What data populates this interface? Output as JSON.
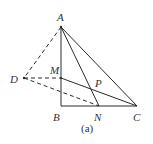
{
  "figure": {
    "caption": "(a)",
    "stroke_color": "#2a2a2a",
    "points": {
      "A": {
        "label": "A",
        "x": 61,
        "y": 27
      },
      "B": {
        "label": "B",
        "x": 61,
        "y": 106
      },
      "C": {
        "label": "C",
        "x": 137,
        "y": 106
      },
      "N": {
        "label": "N",
        "x": 99,
        "y": 106
      },
      "M": {
        "label": "M",
        "x": 61,
        "y": 78
      },
      "D": {
        "label": "D",
        "x": 24,
        "y": 78
      },
      "P": {
        "label": "P",
        "x": 92,
        "y": 89
      }
    },
    "solid_segments": [
      "AB",
      "BC",
      "AC",
      "AN",
      "MC"
    ],
    "dashed_segments": [
      "AD",
      "DM",
      "DN"
    ]
  }
}
